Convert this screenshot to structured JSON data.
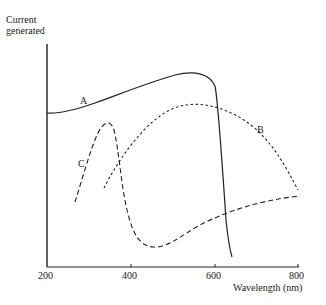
{
  "chart_data": {
    "type": "line",
    "title": "",
    "xlabel": "Wavelength (nm)",
    "ylabel": "Current generated",
    "xlim": [
      200,
      800
    ],
    "xticks": [
      "200",
      "400",
      "600",
      "800"
    ],
    "grid": false,
    "series": [
      {
        "name": "A",
        "style": "solid",
        "x": [
          200,
          250,
          300,
          350,
          400,
          450,
          500,
          550,
          580,
          600,
          620,
          640
        ],
        "y": [
          0.63,
          0.64,
          0.67,
          0.71,
          0.74,
          0.78,
          0.82,
          0.85,
          0.8,
          0.45,
          0.12,
          0.05
        ]
      },
      {
        "name": "B",
        "style": "dotted",
        "x": [
          340,
          380,
          420,
          460,
          500,
          550,
          600,
          650,
          700,
          750,
          800
        ],
        "y": [
          0.34,
          0.48,
          0.6,
          0.67,
          0.71,
          0.72,
          0.7,
          0.65,
          0.57,
          0.44,
          0.34
        ]
      },
      {
        "name": "C",
        "style": "dashed",
        "x": [
          270,
          290,
          310,
          330,
          350,
          370,
          400,
          450,
          500,
          550,
          600,
          650,
          700,
          750,
          800
        ],
        "y": [
          0.29,
          0.42,
          0.55,
          0.6,
          0.52,
          0.33,
          0.15,
          0.08,
          0.12,
          0.19,
          0.24,
          0.29,
          0.32,
          0.35,
          0.37
        ]
      }
    ],
    "annotations": [
      "A",
      "B",
      "C"
    ]
  }
}
